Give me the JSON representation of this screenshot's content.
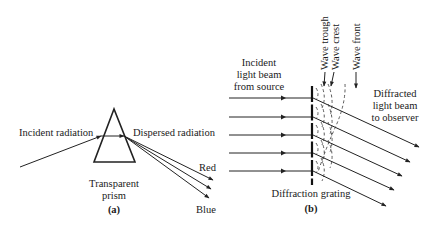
{
  "panel_a": {
    "label_incident": "Incident radiation",
    "label_dispersed": "Dispersed radiation",
    "label_red": "Red",
    "label_blue": "Blue",
    "label_prism_1": "Transparent",
    "label_prism_2": "prism",
    "caption": "(a)"
  },
  "panel_b": {
    "label_incident_1": "Incident",
    "label_incident_2": "light beam",
    "label_incident_3": "from source",
    "label_trough": "Wave trough",
    "label_crest": "Wave crest",
    "label_front": "Wave front",
    "label_diffracted_1": "Diffracted",
    "label_diffracted_2": "light beam",
    "label_diffracted_3": "to observer",
    "label_grating": "Diffraction grating",
    "caption": "(b)"
  },
  "colors": {
    "ink": "#222222",
    "background": "#ffffff"
  }
}
